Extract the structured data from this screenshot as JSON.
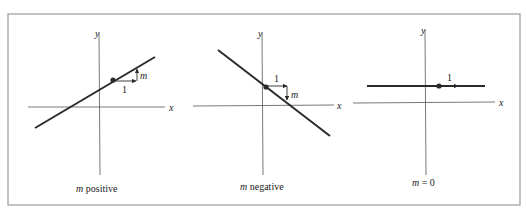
{
  "figure": {
    "colors": {
      "frame": "#9a9a9a",
      "axis": "#555555",
      "line": "#2a2a2a",
      "text": "#222222"
    },
    "panels": [
      {
        "id": "positive",
        "caption_var": "m",
        "caption_rest": " positive",
        "x_label": "x",
        "y_label": "y",
        "run_label": "1",
        "rise_label": "m"
      },
      {
        "id": "negative",
        "caption_var": "m",
        "caption_rest": " negative",
        "x_label": "x",
        "y_label": "y",
        "run_label": "1",
        "rise_label": "m"
      },
      {
        "id": "zero",
        "caption_var": "m",
        "caption_rest": " = 0",
        "x_label": "x",
        "y_label": "y",
        "run_label": "1"
      }
    ]
  }
}
